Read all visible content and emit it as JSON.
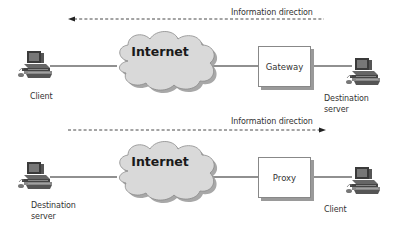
{
  "diagram": {
    "top": {
      "direction_label": "Information direction",
      "arrow_direction": "left",
      "cloud_label": "Internet",
      "box_label": "Gateway",
      "left_node_label": "Client",
      "right_node_label_line1": "Destination",
      "right_node_label_line2": "server"
    },
    "bottom": {
      "direction_label": "Information direction",
      "arrow_direction": "right",
      "cloud_label": "Internet",
      "box_label": "Proxy",
      "left_node_label_line1": "Destination",
      "left_node_label_line2": "server",
      "right_node_label": "Client"
    },
    "colors": {
      "cloud_fill": "#d9d9d9",
      "cloud_shadow": "#a8a8a8",
      "line": "#222222",
      "box_shadow": "#9a9a9a"
    }
  }
}
